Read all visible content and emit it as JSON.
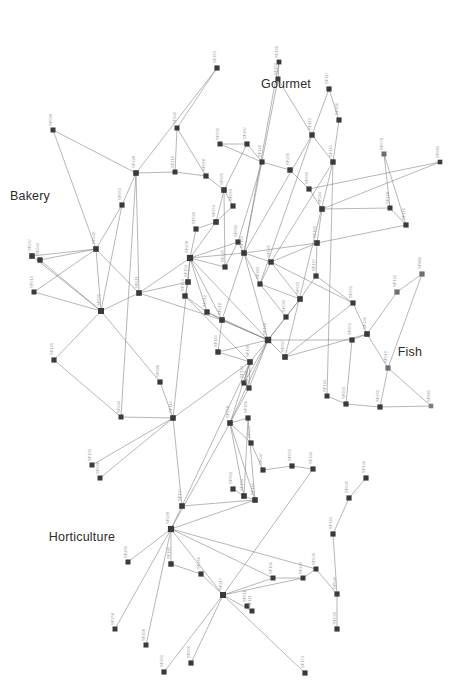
{
  "figure": {
    "type": "network-graph",
    "background_color": "#ffffff",
    "node_color": "#3a3a3a",
    "node_color_light": "#7d7d7d",
    "edge_color": "#7a7a7a",
    "node_label_color": "#9a9a9a",
    "cluster_label_color": "#2b2b2b",
    "node_shape": "square",
    "orientation": "labels rotated 90 degrees"
  },
  "cluster_labels": [
    {
      "text": "Bakery",
      "x": 30,
      "y": 196
    },
    {
      "text": "Gourmet",
      "x": 286,
      "y": 84
    },
    {
      "text": "Fish",
      "x": 410,
      "y": 352
    },
    {
      "text": "Horticulture",
      "x": 82,
      "y": 537
    }
  ],
  "nodes": [
    {
      "id": "SF028",
      "x": 53,
      "y": 130,
      "s": 5.0,
      "c": "#3a3a3a"
    },
    {
      "id": "SF263",
      "x": 217,
      "y": 68,
      "s": 5.2,
      "c": "#3a3a3a"
    },
    {
      "id": "SF081",
      "x": 440,
      "y": 162,
      "s": 4.6,
      "c": "#3a3a3a"
    },
    {
      "id": "SF139",
      "x": 279,
      "y": 62,
      "s": 4.8,
      "c": "#3a3a3a"
    },
    {
      "id": "SF150",
      "x": 278,
      "y": 79,
      "s": 5.0,
      "c": "#3a3a3a"
    },
    {
      "id": "SF117",
      "x": 329,
      "y": 89,
      "s": 5.2,
      "c": "#3a3a3a"
    },
    {
      "id": "SF206",
      "x": 339,
      "y": 120,
      "s": 5.2,
      "c": "#3a3a3a"
    },
    {
      "id": "SF113",
      "x": 312,
      "y": 135,
      "s": 5.4,
      "c": "#3a3a3a"
    },
    {
      "id": "SF114",
      "x": 333,
      "y": 162,
      "s": 5.4,
      "c": "#3a3a3a"
    },
    {
      "id": "SF078",
      "x": 384,
      "y": 154,
      "s": 5.0,
      "c": "#6e6e6e"
    },
    {
      "id": "SF128",
      "x": 390,
      "y": 208,
      "s": 5.0,
      "c": "#3a3a3a"
    },
    {
      "id": "SF121",
      "x": 406,
      "y": 225,
      "s": 5.2,
      "c": "#3a3a3a"
    },
    {
      "id": "SF242",
      "x": 177,
      "y": 128,
      "s": 5.0,
      "c": "#3a3a3a"
    },
    {
      "id": "SF228",
      "x": 136,
      "y": 173,
      "s": 5.6,
      "c": "#3a3a3a"
    },
    {
      "id": "SF216",
      "x": 175,
      "y": 172,
      "s": 5.0,
      "c": "#3a3a3a"
    },
    {
      "id": "SF068",
      "x": 206,
      "y": 176,
      "s": 5.2,
      "c": "#3a3a3a"
    },
    {
      "id": "SF065",
      "x": 220,
      "y": 144,
      "s": 5.0,
      "c": "#3a3a3a"
    },
    {
      "id": "SF063",
      "x": 122,
      "y": 205,
      "s": 5.2,
      "c": "#3a3a3a"
    },
    {
      "id": "SF042",
      "x": 96,
      "y": 249,
      "s": 5.6,
      "c": "#3a3a3a"
    },
    {
      "id": "SF007",
      "x": 32,
      "y": 256,
      "s": 5.6,
      "c": "#3a3a3a"
    },
    {
      "id": "SF043",
      "x": 40,
      "y": 260,
      "s": 5.4,
      "c": "#3a3a3a"
    },
    {
      "id": "SF019",
      "x": 34,
      "y": 292,
      "s": 5.0,
      "c": "#3a3a3a"
    },
    {
      "id": "SF031",
      "x": 101,
      "y": 311,
      "s": 6.0,
      "c": "#3a3a3a"
    },
    {
      "id": "SF011",
      "x": 139,
      "y": 293,
      "s": 5.6,
      "c": "#3a3a3a"
    },
    {
      "id": "SF120",
      "x": 54,
      "y": 360,
      "s": 5.2,
      "c": "#3a3a3a"
    },
    {
      "id": "SF088",
      "x": 160,
      "y": 382,
      "s": 5.2,
      "c": "#3a3a3a"
    },
    {
      "id": "SF044",
      "x": 121,
      "y": 417,
      "s": 5.0,
      "c": "#3a3a3a"
    },
    {
      "id": "SF101",
      "x": 92,
      "y": 465,
      "s": 5.0,
      "c": "#3a3a3a"
    },
    {
      "id": "SF098",
      "x": 100,
      "y": 478,
      "s": 5.0,
      "c": "#3a3a3a"
    },
    {
      "id": "SF113b",
      "x": 173,
      "y": 418,
      "s": 5.6,
      "c": "#3a3a3a"
    },
    {
      "id": "SF208",
      "x": 190,
      "y": 258,
      "s": 6.2,
      "c": "#3a3a3a"
    },
    {
      "id": "SF154",
      "x": 188,
      "y": 282,
      "s": 5.6,
      "c": "#3a3a3a"
    },
    {
      "id": "SF174",
      "x": 185,
      "y": 296,
      "s": 5.4,
      "c": "#3a3a3a"
    },
    {
      "id": "SF082",
      "x": 238,
      "y": 242,
      "s": 5.2,
      "c": "#3a3a3a"
    },
    {
      "id": "SF152",
      "x": 244,
      "y": 253,
      "s": 5.6,
      "c": "#3a3a3a"
    },
    {
      "id": "SF095",
      "x": 271,
      "y": 262,
      "s": 5.4,
      "c": "#3a3a3a"
    },
    {
      "id": "SF283",
      "x": 260,
      "y": 284,
      "s": 5.2,
      "c": "#3a3a3a"
    },
    {
      "id": "SF001",
      "x": 353,
      "y": 303,
      "s": 5.2,
      "c": "#3a3a3a"
    },
    {
      "id": "SF131",
      "x": 397,
      "y": 292,
      "s": 5.2,
      "c": "#6e6e6e"
    },
    {
      "id": "SF881",
      "x": 422,
      "y": 274,
      "s": 5.2,
      "c": "#6e6e6e"
    },
    {
      "id": "SF240",
      "x": 367,
      "y": 334,
      "s": 5.6,
      "c": "#3a3a3a"
    },
    {
      "id": "SF051",
      "x": 352,
      "y": 340,
      "s": 5.2,
      "c": "#3a3a3a"
    },
    {
      "id": "SF010",
      "x": 388,
      "y": 368,
      "s": 5.2,
      "c": "#6e6e6e"
    },
    {
      "id": "SF885",
      "x": 431,
      "y": 406,
      "s": 4.6,
      "c": "#7d7d7d"
    },
    {
      "id": "SF291",
      "x": 380,
      "y": 407,
      "s": 5.2,
      "c": "#3a3a3a"
    },
    {
      "id": "SF003",
      "x": 346,
      "y": 404,
      "s": 5.2,
      "c": "#3a3a3a"
    },
    {
      "id": "SF124",
      "x": 327,
      "y": 396,
      "s": 5.0,
      "c": "#3a3a3a"
    },
    {
      "id": "SF196",
      "x": 250,
      "y": 362,
      "s": 5.6,
      "c": "#3a3a3a"
    },
    {
      "id": "SF128b",
      "x": 268,
      "y": 340,
      "s": 6.4,
      "c": "#3a3a3a"
    },
    {
      "id": "SF067",
      "x": 285,
      "y": 357,
      "s": 5.6,
      "c": "#3a3a3a"
    },
    {
      "id": "SF168",
      "x": 249,
      "y": 388,
      "s": 5.2,
      "c": "#3a3a3a"
    },
    {
      "id": "SF058",
      "x": 230,
      "y": 423,
      "s": 5.6,
      "c": "#3a3a3a"
    },
    {
      "id": "SF166",
      "x": 248,
      "y": 418,
      "s": 5.2,
      "c": "#3a3a3a"
    },
    {
      "id": "SF134",
      "x": 244,
      "y": 383,
      "s": 5.2,
      "c": "#3a3a3a"
    },
    {
      "id": "SF091",
      "x": 251,
      "y": 443,
      "s": 5.2,
      "c": "#3a3a3a"
    },
    {
      "id": "SF047",
      "x": 263,
      "y": 470,
      "s": 5.2,
      "c": "#3a3a3a"
    },
    {
      "id": "SF055",
      "x": 292,
      "y": 466,
      "s": 5.2,
      "c": "#3a3a3a"
    },
    {
      "id": "SF242b",
      "x": 313,
      "y": 469,
      "s": 5.2,
      "c": "#3a3a3a"
    },
    {
      "id": "SF193",
      "x": 244,
      "y": 496,
      "s": 5.6,
      "c": "#3a3a3a"
    },
    {
      "id": "SF137",
      "x": 182,
      "y": 506,
      "s": 5.6,
      "c": "#3a3a3a"
    },
    {
      "id": "SF228b",
      "x": 171,
      "y": 529,
      "s": 6.2,
      "c": "#3a3a3a"
    },
    {
      "id": "SF185",
      "x": 171,
      "y": 564,
      "s": 5.4,
      "c": "#3a3a3a"
    },
    {
      "id": "SF066",
      "x": 201,
      "y": 574,
      "s": 5.2,
      "c": "#3a3a3a"
    },
    {
      "id": "SF217",
      "x": 223,
      "y": 595,
      "s": 6.0,
      "c": "#3a3a3a"
    },
    {
      "id": "SF296",
      "x": 128,
      "y": 562,
      "s": 5.0,
      "c": "#3a3a3a"
    },
    {
      "id": "SF258",
      "x": 115,
      "y": 629,
      "s": 5.0,
      "c": "#3a3a3a"
    },
    {
      "id": "SF208b",
      "x": 146,
      "y": 645,
      "s": 5.0,
      "c": "#3a3a3a"
    },
    {
      "id": "SF261",
      "x": 164,
      "y": 672,
      "s": 5.2,
      "c": "#3a3a3a"
    },
    {
      "id": "SF006",
      "x": 191,
      "y": 663,
      "s": 5.2,
      "c": "#3a3a3a"
    },
    {
      "id": "SF116",
      "x": 255,
      "y": 500,
      "s": 5.6,
      "c": "#3a3a3a"
    },
    {
      "id": "SF224",
      "x": 333,
      "y": 534,
      "s": 5.2,
      "c": "#3a3a3a"
    },
    {
      "id": "SF045",
      "x": 349,
      "y": 498,
      "s": 5.2,
      "c": "#3a3a3a"
    },
    {
      "id": "SF049",
      "x": 316,
      "y": 569,
      "s": 5.0,
      "c": "#3a3a3a"
    },
    {
      "id": "SF046",
      "x": 337,
      "y": 594,
      "s": 5.2,
      "c": "#3a3a3a"
    },
    {
      "id": "SF033",
      "x": 337,
      "y": 629,
      "s": 5.2,
      "c": "#3a3a3a"
    },
    {
      "id": "SF221",
      "x": 303,
      "y": 578,
      "s": 5.0,
      "c": "#3a3a3a"
    },
    {
      "id": "SF106",
      "x": 273,
      "y": 578,
      "s": 5.0,
      "c": "#3a3a3a"
    },
    {
      "id": "SF111",
      "x": 252,
      "y": 611,
      "s": 5.0,
      "c": "#3a3a3a"
    },
    {
      "id": "SF011b",
      "x": 247,
      "y": 606,
      "s": 5.0,
      "c": "#3a3a3a"
    },
    {
      "id": "SF173",
      "x": 305,
      "y": 673,
      "s": 5.2,
      "c": "#3a3a3a"
    },
    {
      "id": "SF149",
      "x": 366,
      "y": 478,
      "s": 5.2,
      "c": "#3a3a3a"
    },
    {
      "id": "SF030",
      "x": 286,
      "y": 317,
      "s": 5.2,
      "c": "#3a3a3a"
    },
    {
      "id": "SF093",
      "x": 300,
      "y": 299,
      "s": 5.6,
      "c": "#3a3a3a"
    },
    {
      "id": "SF127",
      "x": 316,
      "y": 276,
      "s": 5.2,
      "c": "#3a3a3a"
    },
    {
      "id": "SF160",
      "x": 317,
      "y": 243,
      "s": 5.6,
      "c": "#3a3a3a"
    },
    {
      "id": "SF024",
      "x": 322,
      "y": 209,
      "s": 5.6,
      "c": "#3a3a3a"
    },
    {
      "id": "SF090",
      "x": 309,
      "y": 189,
      "s": 5.2,
      "c": "#3a3a3a"
    },
    {
      "id": "SF236",
      "x": 290,
      "y": 170,
      "s": 5.4,
      "c": "#3a3a3a"
    },
    {
      "id": "SF122",
      "x": 262,
      "y": 162,
      "s": 5.2,
      "c": "#3a3a3a"
    },
    {
      "id": "SF287",
      "x": 247,
      "y": 144,
      "s": 5.2,
      "c": "#3a3a3a"
    },
    {
      "id": "SF005",
      "x": 224,
      "y": 190,
      "s": 5.6,
      "c": "#3a3a3a"
    },
    {
      "id": "SF053",
      "x": 216,
      "y": 222,
      "s": 5.6,
      "c": "#3a3a3a"
    },
    {
      "id": "SF026",
      "x": 196,
      "y": 229,
      "s": 5.2,
      "c": "#3a3a3a"
    },
    {
      "id": "SF069",
      "x": 233,
      "y": 206,
      "s": 5.2,
      "c": "#3a3a3a"
    },
    {
      "id": "SF012",
      "x": 207,
      "y": 312,
      "s": 5.4,
      "c": "#3a3a3a"
    },
    {
      "id": "SF018",
      "x": 222,
      "y": 320,
      "s": 5.6,
      "c": "#3a3a3a"
    },
    {
      "id": "SF235",
      "x": 225,
      "y": 267,
      "s": 5.2,
      "c": "#3a3a3a"
    },
    {
      "id": "SF119",
      "x": 218,
      "y": 352,
      "s": 5.4,
      "c": "#3a3a3a"
    },
    {
      "id": "SF062",
      "x": 233,
      "y": 489,
      "s": 5.2,
      "c": "#3a3a3a"
    }
  ],
  "edges": [
    [
      "SF028",
      "SF228"
    ],
    [
      "SF028",
      "SF042"
    ],
    [
      "SF263",
      "SF228"
    ],
    [
      "SF263",
      "SF242"
    ],
    [
      "SF242",
      "SF216"
    ],
    [
      "SF242",
      "SF068"
    ],
    [
      "SF228",
      "SF063"
    ],
    [
      "SF228",
      "SF216"
    ],
    [
      "SF228",
      "SF044"
    ],
    [
      "SF228",
      "SF011"
    ],
    [
      "SF063",
      "SF042"
    ],
    [
      "SF063",
      "SF031"
    ],
    [
      "SF042",
      "SF007"
    ],
    [
      "SF042",
      "SF043"
    ],
    [
      "SF042",
      "SF031"
    ],
    [
      "SF042",
      "SF011"
    ],
    [
      "SF007",
      "SF031"
    ],
    [
      "SF043",
      "SF031"
    ],
    [
      "SF019",
      "SF031"
    ],
    [
      "SF019",
      "SF042"
    ],
    [
      "SF031",
      "SF120"
    ],
    [
      "SF031",
      "SF011"
    ],
    [
      "SF031",
      "SF088"
    ],
    [
      "SF011",
      "SF208"
    ],
    [
      "SF120",
      "SF044"
    ],
    [
      "SF088",
      "SF113b"
    ],
    [
      "SF044",
      "SF113b"
    ],
    [
      "SF101",
      "SF113b"
    ],
    [
      "SF098",
      "SF113b"
    ],
    [
      "SF113b",
      "SF208"
    ],
    [
      "SF113b",
      "SF196"
    ],
    [
      "SF216",
      "SF068"
    ],
    [
      "SF068",
      "SF005"
    ],
    [
      "SF065",
      "SF287"
    ],
    [
      "SF065",
      "SF122"
    ],
    [
      "SF139",
      "SF150"
    ],
    [
      "SF150",
      "SF113"
    ],
    [
      "SF150",
      "SF152"
    ],
    [
      "SF139",
      "SF152"
    ],
    [
      "SF117",
      "SF113"
    ],
    [
      "SF117",
      "SF206"
    ],
    [
      "SF206",
      "SF114"
    ],
    [
      "SF113",
      "SF114"
    ],
    [
      "SF113",
      "SF152"
    ],
    [
      "SF114",
      "SF095"
    ],
    [
      "SF114",
      "SF124"
    ],
    [
      "SF078",
      "SF128"
    ],
    [
      "SF078",
      "SF121"
    ],
    [
      "SF128",
      "SF121"
    ],
    [
      "SF128",
      "SF024"
    ],
    [
      "SF121",
      "SF160"
    ],
    [
      "SF081",
      "SF090"
    ],
    [
      "SF081",
      "SF024"
    ],
    [
      "SF090",
      "SF236"
    ],
    [
      "SF236",
      "SF122"
    ],
    [
      "SF122",
      "SF287"
    ],
    [
      "SF287",
      "SF005"
    ],
    [
      "SF005",
      "SF053"
    ],
    [
      "SF053",
      "SF026"
    ],
    [
      "SF053",
      "SF069"
    ],
    [
      "SF069",
      "SF005"
    ],
    [
      "SF026",
      "SF208"
    ],
    [
      "SF053",
      "SF208"
    ],
    [
      "SF208",
      "SF154"
    ],
    [
      "SF154",
      "SF174"
    ],
    [
      "SF174",
      "SF012"
    ],
    [
      "SF208",
      "SF082"
    ],
    [
      "SF082",
      "SF152"
    ],
    [
      "SF152",
      "SF095"
    ],
    [
      "SF095",
      "SF283"
    ],
    [
      "SF283",
      "SF093"
    ],
    [
      "SF093",
      "SF030"
    ],
    [
      "SF030",
      "SF128b"
    ],
    [
      "SF127",
      "SF093"
    ],
    [
      "SF160",
      "SF127"
    ],
    [
      "SF024",
      "SF160"
    ],
    [
      "SF024",
      "SF090"
    ],
    [
      "SF012",
      "SF018"
    ],
    [
      "SF018",
      "SF119"
    ],
    [
      "SF119",
      "SF128b"
    ],
    [
      "SF128b",
      "SF067"
    ],
    [
      "SF067",
      "SF001"
    ],
    [
      "SF001",
      "SF240"
    ],
    [
      "SF240",
      "SF051"
    ],
    [
      "SF240",
      "SF010"
    ],
    [
      "SF010",
      "SF291"
    ],
    [
      "SF010",
      "SF885"
    ],
    [
      "SF291",
      "SF885"
    ],
    [
      "SF131",
      "SF881"
    ],
    [
      "SF131",
      "SF240"
    ],
    [
      "SF881",
      "SF010"
    ],
    [
      "SF003",
      "SF291"
    ],
    [
      "SF124",
      "SF003"
    ],
    [
      "SF196",
      "SF168"
    ],
    [
      "SF168",
      "SF058"
    ],
    [
      "SF058",
      "SF166"
    ],
    [
      "SF134",
      "SF196"
    ],
    [
      "SF091",
      "SF058"
    ],
    [
      "SF047",
      "SF091"
    ],
    [
      "SF055",
      "SF047"
    ],
    [
      "SF242b",
      "SF055"
    ],
    [
      "SF193",
      "SF116"
    ],
    [
      "SF116",
      "SF228b"
    ],
    [
      "SF137",
      "SF228b"
    ],
    [
      "SF228b",
      "SF185"
    ],
    [
      "SF185",
      "SF066"
    ],
    [
      "SF066",
      "SF217"
    ],
    [
      "SF296",
      "SF228b"
    ],
    [
      "SF258",
      "SF228b"
    ],
    [
      "SF208b",
      "SF228b"
    ],
    [
      "SF261",
      "SF217"
    ],
    [
      "SF006",
      "SF217"
    ],
    [
      "SF217",
      "SF106"
    ],
    [
      "SF106",
      "SF221"
    ],
    [
      "SF221",
      "SF049"
    ],
    [
      "SF049",
      "SF046"
    ],
    [
      "SF046",
      "SF033"
    ],
    [
      "SF224",
      "SF045"
    ],
    [
      "SF224",
      "SF046"
    ],
    [
      "SF045",
      "SF149"
    ],
    [
      "SF173",
      "SF217"
    ],
    [
      "SF111",
      "SF217"
    ],
    [
      "SF062",
      "SF193"
    ],
    [
      "SF193",
      "SF058"
    ],
    [
      "SF116",
      "SF166"
    ],
    [
      "SF137",
      "SF196"
    ],
    [
      "SF228b",
      "SF217"
    ],
    [
      "SF228b",
      "SF106"
    ],
    [
      "SF228b",
      "SF049"
    ],
    [
      "SF128b",
      "SF196"
    ],
    [
      "SF128b",
      "SF152"
    ],
    [
      "SF128b",
      "SF093"
    ],
    [
      "SF128b",
      "SF018"
    ],
    [
      "SF128b",
      "SF058"
    ],
    [
      "SF128b",
      "SF051"
    ],
    [
      "SF208",
      "SF152"
    ],
    [
      "SF208",
      "SF128b"
    ],
    [
      "SF208",
      "SF018"
    ],
    [
      "SF208",
      "SF012"
    ],
    [
      "SF152",
      "SF018"
    ],
    [
      "SF095",
      "SF001"
    ],
    [
      "SF051",
      "SF003"
    ],
    [
      "SF067",
      "SF240"
    ],
    [
      "SF166",
      "SF193"
    ],
    [
      "SF058",
      "SF116"
    ],
    [
      "SF217",
      "SF242b"
    ],
    [
      "SF217",
      "SF221"
    ],
    [
      "SF128b",
      "SF134"
    ],
    [
      "SF128b",
      "SF168"
    ],
    [
      "SF235",
      "SF208"
    ],
    [
      "SF235",
      "SF082"
    ],
    [
      "SF005",
      "SF235"
    ],
    [
      "SF093",
      "SF095"
    ],
    [
      "SF030",
      "SF283"
    ],
    [
      "SF119",
      "SF196"
    ],
    [
      "SF018",
      "SF128b"
    ],
    [
      "SF012",
      "SF128b"
    ],
    [
      "SF011",
      "SF154"
    ],
    [
      "SF011",
      "SF018"
    ],
    [
      "SF113b",
      "SF137"
    ],
    [
      "SF196",
      "SF058"
    ],
    [
      "SF228b",
      "SF058"
    ],
    [
      "SF137",
      "SF116"
    ],
    [
      "SF152",
      "SF160"
    ],
    [
      "SF082",
      "SF122"
    ],
    [
      "SF095",
      "SF160"
    ],
    [
      "SF127",
      "SF001"
    ],
    [
      "SF113",
      "SF283"
    ],
    [
      "SF114",
      "SF067"
    ],
    [
      "SF152",
      "SF283"
    ],
    [
      "SF174",
      "SF196"
    ]
  ]
}
